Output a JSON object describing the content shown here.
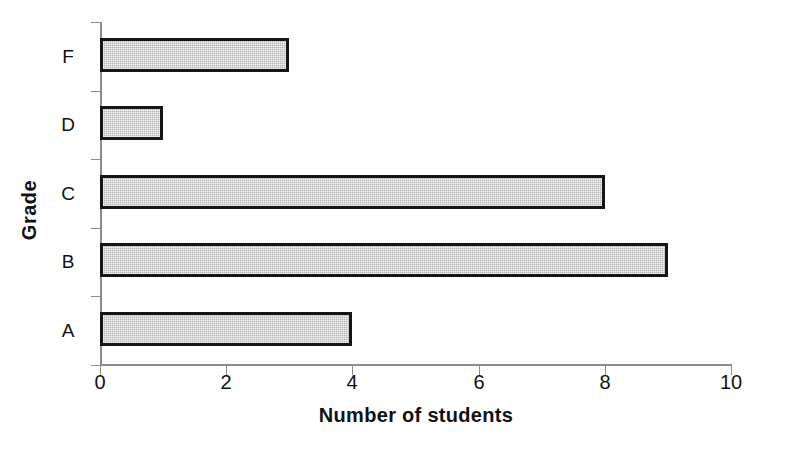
{
  "chart_data": {
    "type": "bar",
    "orientation": "horizontal",
    "title": "",
    "xlabel": "Number of students",
    "ylabel": "Grade",
    "categories": [
      "A",
      "B",
      "C",
      "D",
      "F"
    ],
    "values": [
      4,
      9,
      8,
      1,
      3
    ],
    "category_order_top_to_bottom": [
      "F",
      "D",
      "C",
      "B",
      "A"
    ],
    "xlim": [
      0,
      10
    ],
    "xticks": [
      0,
      2,
      4,
      6,
      8,
      10
    ],
    "xtick_labels": [
      "0",
      "2",
      "4",
      "6",
      "8",
      "10"
    ],
    "grid": false,
    "legend": null,
    "series": [
      {
        "name": "Number of students",
        "bar_fill_color": "#b4b4b4",
        "bar_border_color": "#151515",
        "points": [
          {
            "category": "F",
            "value": 3
          },
          {
            "category": "D",
            "value": 1
          },
          {
            "category": "C",
            "value": 8
          },
          {
            "category": "B",
            "value": 9
          },
          {
            "category": "A",
            "value": 4
          }
        ]
      }
    ]
  },
  "axes": {
    "y_title": "Grade",
    "x_title": "Number of students",
    "y_categories_top_to_bottom": [
      {
        "label": "F",
        "value": 3
      },
      {
        "label": "D",
        "value": 1
      },
      {
        "label": "C",
        "value": 8
      },
      {
        "label": "B",
        "value": 9
      },
      {
        "label": "A",
        "value": 4
      }
    ],
    "x_tick_labels": [
      "0",
      "2",
      "4",
      "6",
      "8",
      "10"
    ],
    "axis_color": "#8c8c8c"
  },
  "colors": {
    "background": "#ffffff",
    "bar_fill": "#b4b4b4",
    "bar_border": "#151515",
    "text": "#111111",
    "axis": "#8c8c8c"
  }
}
